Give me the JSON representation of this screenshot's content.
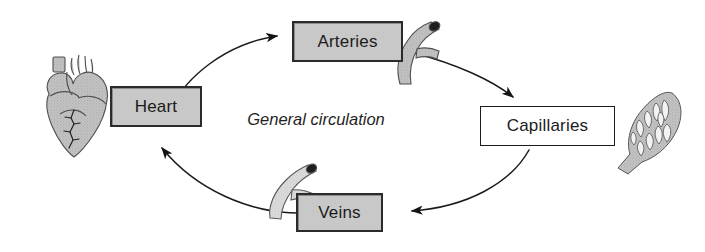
{
  "diagram": {
    "title_caption": "General circulation",
    "nodes": [
      {
        "id": "heart",
        "label": "Heart",
        "fill": "#c8c8c8",
        "style": "filled"
      },
      {
        "id": "arteries",
        "label": "Arteries",
        "fill": "#c8c8c8",
        "style": "filled"
      },
      {
        "id": "capillaries",
        "label": "Capillaries",
        "fill": "#ffffff",
        "style": "hollow"
      },
      {
        "id": "veins",
        "label": "Veins",
        "fill": "#c8c8c8",
        "style": "filled"
      }
    ],
    "arrows": [
      {
        "from": "heart",
        "to": "arteries",
        "direction": "up-right"
      },
      {
        "from": "arteries",
        "to": "capillaries",
        "direction": "down-right"
      },
      {
        "from": "capillaries",
        "to": "veins",
        "direction": "down-left"
      },
      {
        "from": "veins",
        "to": "heart",
        "direction": "up-left"
      }
    ],
    "illustrations": [
      {
        "id": "heart-illustration",
        "name": "anatomical-heart-icon"
      },
      {
        "id": "artery-illustration",
        "name": "artery-vessel-icon"
      },
      {
        "id": "capillary-illustration",
        "name": "capillary-bed-icon"
      },
      {
        "id": "vein-illustration",
        "name": "vein-vessel-icon"
      }
    ],
    "colors": {
      "line": "#1b1b1b",
      "box_fill_gray": "#c8c8c8",
      "box_fill_white": "#ffffff",
      "illustration_gray": "#b4b4b4",
      "illustration_light_gray": "#d2d2d2",
      "illustration_outline": "#4a4a4a",
      "background": "#ffffff"
    }
  }
}
